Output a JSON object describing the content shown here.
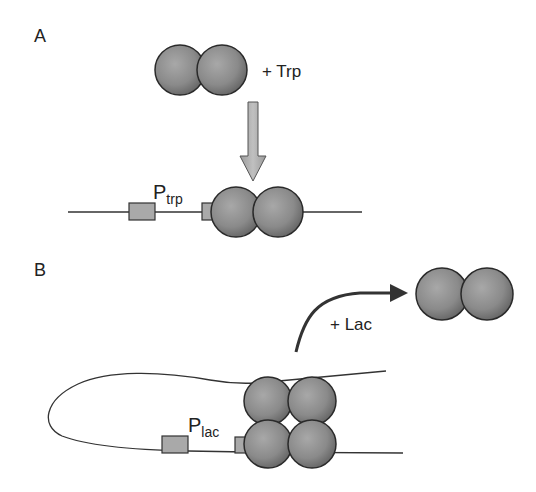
{
  "panels": {
    "a": {
      "label": "A",
      "ligand": "+ Trp",
      "promoter_P": "P",
      "promoter_sub": "trp"
    },
    "b": {
      "label": "B",
      "ligand": "+ Lac",
      "promoter_P": "P",
      "promoter_sub": "lac"
    }
  },
  "colors": {
    "protein_fill_light": "#b8b8b8",
    "protein_fill_dark": "#6a6a6a",
    "protein_stroke": "#2a2a2a",
    "box_fill": "#a9a9a9",
    "dna_line": "#333333",
    "arrow_fill": "#a8a8a8",
    "curved_arrow": "#333333"
  }
}
